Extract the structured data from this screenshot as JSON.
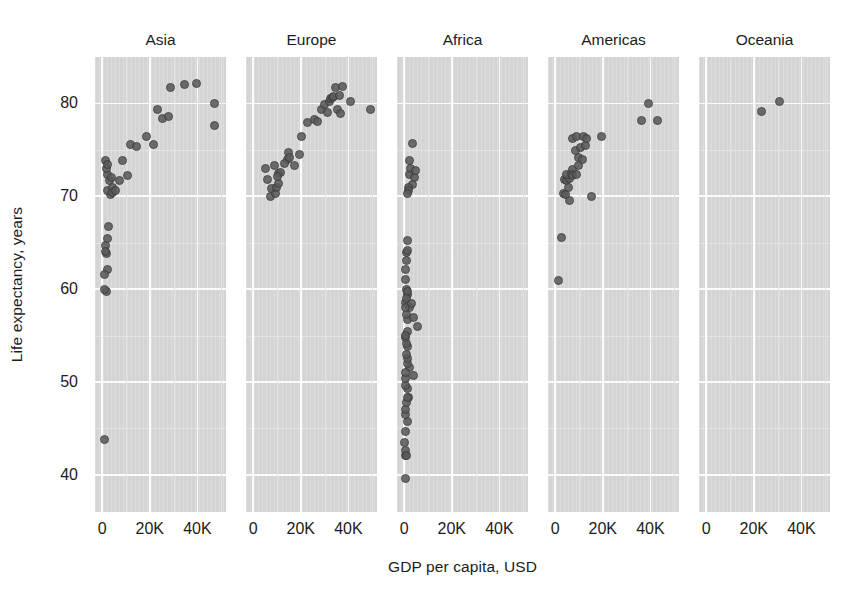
{
  "chart_data": {
    "type": "scatter",
    "title": "",
    "xlabel": "GDP per capita, USD",
    "ylabel": "Life expectancy, years",
    "xlim": [
      -3000,
      52000
    ],
    "ylim": [
      36,
      85
    ],
    "xticks": [
      0,
      20000,
      40000
    ],
    "xticklabels": [
      "0",
      "20K",
      "40K"
    ],
    "yticks": [
      40,
      50,
      60,
      70,
      80
    ],
    "yticklabels": [
      "40",
      "50",
      "60",
      "70",
      "80"
    ],
    "grid": true,
    "legend": "none",
    "facet_by": "continent",
    "marker": {
      "shape": "circle",
      "color": "#5b5b5b",
      "edge_color": "#3a3a3a",
      "size": 9,
      "opacity": 0.88
    },
    "panel_background": "#d4d4d4",
    "gridline_color": "#fbfbfb",
    "facets": [
      {
        "name": "Asia",
        "points": [
          {
            "x": 944,
            "y": 43.8
          },
          {
            "x": 1391,
            "y": 64.7
          },
          {
            "x": 1713,
            "y": 59.7
          },
          {
            "x": 2441,
            "y": 62.1
          },
          {
            "x": 1803,
            "y": 63.8
          },
          {
            "x": 2082,
            "y": 65.5
          },
          {
            "x": 1324,
            "y": 64.1
          },
          {
            "x": 2605,
            "y": 66.8
          },
          {
            "x": 780,
            "y": 60.0
          },
          {
            "x": 1107,
            "y": 61.6
          },
          {
            "x": 3540,
            "y": 70.2
          },
          {
            "x": 2452,
            "y": 70.6
          },
          {
            "x": 3096,
            "y": 71.7
          },
          {
            "x": 2280,
            "y": 72.4
          },
          {
            "x": 4471,
            "y": 71.0
          },
          {
            "x": 3823,
            "y": 72.0
          },
          {
            "x": 2013,
            "y": 73.0
          },
          {
            "x": 1593,
            "y": 73.9
          },
          {
            "x": 2441,
            "y": 73.4
          },
          {
            "x": 4519,
            "y": 70.4
          },
          {
            "x": 5754,
            "y": 70.6
          },
          {
            "x": 7458,
            "y": 71.7
          },
          {
            "x": 8458,
            "y": 73.9
          },
          {
            "x": 10462,
            "y": 72.2
          },
          {
            "x": 12057,
            "y": 75.6
          },
          {
            "x": 14619,
            "y": 75.4
          },
          {
            "x": 18679,
            "y": 76.4
          },
          {
            "x": 21655,
            "y": 75.6
          },
          {
            "x": 23348,
            "y": 79.4
          },
          {
            "x": 25523,
            "y": 78.4
          },
          {
            "x": 28718,
            "y": 81.7
          },
          {
            "x": 28026,
            "y": 78.6
          },
          {
            "x": 34435,
            "y": 82.0
          },
          {
            "x": 39725,
            "y": 82.2
          },
          {
            "x": 47143,
            "y": 80.0
          },
          {
            "x": 47307,
            "y": 77.6
          }
        ]
      },
      {
        "name": "Europe",
        "points": [
          {
            "x": 5937,
            "y": 71.8
          },
          {
            "x": 7446,
            "y": 70.0
          },
          {
            "x": 7758,
            "y": 70.8
          },
          {
            "x": 9254,
            "y": 70.3
          },
          {
            "x": 9787,
            "y": 71.0
          },
          {
            "x": 10681,
            "y": 71.4
          },
          {
            "x": 5228,
            "y": 73.0
          },
          {
            "x": 10808,
            "y": 72.5
          },
          {
            "x": 11605,
            "y": 72.6
          },
          {
            "x": 9065,
            "y": 73.3
          },
          {
            "x": 14619,
            "y": 74.0
          },
          {
            "x": 14984,
            "y": 74.7
          },
          {
            "x": 17171,
            "y": 73.3
          },
          {
            "x": 19384,
            "y": 74.5
          },
          {
            "x": 20510,
            "y": 76.4
          },
          {
            "x": 22833,
            "y": 77.9
          },
          {
            "x": 25768,
            "y": 78.3
          },
          {
            "x": 26891,
            "y": 78.1
          },
          {
            "x": 28569,
            "y": 79.4
          },
          {
            "x": 29796,
            "y": 79.9
          },
          {
            "x": 31163,
            "y": 79.0
          },
          {
            "x": 32170,
            "y": 80.2
          },
          {
            "x": 32686,
            "y": 80.5
          },
          {
            "x": 33203,
            "y": 80.6
          },
          {
            "x": 33860,
            "y": 80.7
          },
          {
            "x": 34480,
            "y": 81.7
          },
          {
            "x": 35278,
            "y": 79.3
          },
          {
            "x": 36126,
            "y": 80.9
          },
          {
            "x": 36797,
            "y": 78.9
          },
          {
            "x": 37506,
            "y": 81.8
          },
          {
            "x": 40676,
            "y": 80.2
          },
          {
            "x": 49357,
            "y": 79.4
          },
          {
            "x": 15389,
            "y": 74.2
          },
          {
            "x": 13206,
            "y": 73.5
          },
          {
            "x": 10249,
            "y": 72.1
          }
        ]
      },
      {
        "name": "Africa",
        "points": [
          {
            "x": 430,
            "y": 39.6
          },
          {
            "x": 541,
            "y": 42.1
          },
          {
            "x": 690,
            "y": 42.6
          },
          {
            "x": 863,
            "y": 42.1
          },
          {
            "x": 277,
            "y": 43.5
          },
          {
            "x": 619,
            "y": 44.7
          },
          {
            "x": 1217,
            "y": 45.7
          },
          {
            "x": 414,
            "y": 46.5
          },
          {
            "x": 2013,
            "y": 48.3
          },
          {
            "x": 706,
            "y": 47.0
          },
          {
            "x": 823,
            "y": 47.8
          },
          {
            "x": 1217,
            "y": 48.3
          },
          {
            "x": 1569,
            "y": 49.3
          },
          {
            "x": 469,
            "y": 49.6
          },
          {
            "x": 641,
            "y": 50.4
          },
          {
            "x": 3820,
            "y": 50.7
          },
          {
            "x": 2042,
            "y": 51.6
          },
          {
            "x": 1544,
            "y": 52.0
          },
          {
            "x": 1217,
            "y": 52.5
          },
          {
            "x": 995,
            "y": 53.0
          },
          {
            "x": 1271,
            "y": 53.8
          },
          {
            "x": 863,
            "y": 54.1
          },
          {
            "x": 706,
            "y": 54.8
          },
          {
            "x": 1598,
            "y": 55.4
          },
          {
            "x": 5581,
            "y": 56.0
          },
          {
            "x": 1544,
            "y": 56.7
          },
          {
            "x": 1091,
            "y": 57.3
          },
          {
            "x": 2280,
            "y": 58.0
          },
          {
            "x": 758,
            "y": 58.6
          },
          {
            "x": 641,
            "y": 58.0
          },
          {
            "x": 1327,
            "y": 59.4
          },
          {
            "x": 906,
            "y": 60.0
          },
          {
            "x": 1569,
            "y": 59.7
          },
          {
            "x": 541,
            "y": 62.1
          },
          {
            "x": 1091,
            "y": 63.1
          },
          {
            "x": 895,
            "y": 64.0
          },
          {
            "x": 1327,
            "y": 64.2
          },
          {
            "x": 1217,
            "y": 65.2
          },
          {
            "x": 3632,
            "y": 71.3
          },
          {
            "x": 2082,
            "y": 72.3
          },
          {
            "x": 1713,
            "y": 71.0
          },
          {
            "x": 4519,
            "y": 72.0
          },
          {
            "x": 2605,
            "y": 73.0
          },
          {
            "x": 4797,
            "y": 72.8
          },
          {
            "x": 2441,
            "y": 73.9
          },
          {
            "x": 3540,
            "y": 75.7
          },
          {
            "x": 1803,
            "y": 70.6
          },
          {
            "x": 1391,
            "y": 70.3
          },
          {
            "x": 806,
            "y": 59.0
          },
          {
            "x": 706,
            "y": 61.0
          },
          {
            "x": 570,
            "y": 55.0
          },
          {
            "x": 490,
            "y": 51.0
          },
          {
            "x": 2910,
            "y": 58.5
          },
          {
            "x": 4100,
            "y": 57.0
          }
        ]
      },
      {
        "name": "Americas",
        "points": [
          {
            "x": 1202,
            "y": 60.9
          },
          {
            "x": 2749,
            "y": 65.6
          },
          {
            "x": 3548,
            "y": 70.3
          },
          {
            "x": 4172,
            "y": 70.2
          },
          {
            "x": 3822,
            "y": 71.8
          },
          {
            "x": 4959,
            "y": 71.7
          },
          {
            "x": 5728,
            "y": 71.0
          },
          {
            "x": 6025,
            "y": 71.9
          },
          {
            "x": 4797,
            "y": 72.4
          },
          {
            "x": 6873,
            "y": 72.5
          },
          {
            "x": 7320,
            "y": 72.9
          },
          {
            "x": 7409,
            "y": 72.2
          },
          {
            "x": 8948,
            "y": 72.4
          },
          {
            "x": 9645,
            "y": 73.3
          },
          {
            "x": 9809,
            "y": 74.2
          },
          {
            "x": 11416,
            "y": 74.0
          },
          {
            "x": 8458,
            "y": 74.9
          },
          {
            "x": 10611,
            "y": 75.3
          },
          {
            "x": 12569,
            "y": 75.5
          },
          {
            "x": 7408,
            "y": 76.2
          },
          {
            "x": 9066,
            "y": 76.4
          },
          {
            "x": 11978,
            "y": 76.4
          },
          {
            "x": 13172,
            "y": 76.2
          },
          {
            "x": 19328,
            "y": 76.4
          },
          {
            "x": 36320,
            "y": 78.2
          },
          {
            "x": 42952,
            "y": 78.2
          },
          {
            "x": 39097,
            "y": 80.0
          },
          {
            "x": 15390,
            "y": 70.0
          },
          {
            "x": 5937,
            "y": 69.6
          }
        ]
      },
      {
        "name": "Oceania",
        "points": [
          {
            "x": 23189,
            "y": 79.1
          },
          {
            "x": 30900,
            "y": 80.2
          }
        ]
      }
    ]
  },
  "axis": {
    "y_title": "Life expectancy, years",
    "x_title": "GDP per capita, USD"
  }
}
